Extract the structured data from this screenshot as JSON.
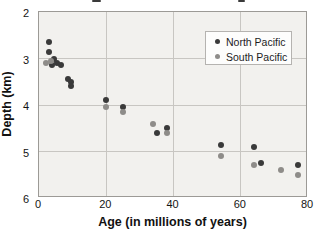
{
  "figure": {
    "y_axis_label": "Depth (km)",
    "x_axis_label": "Age (in millions of years)"
  },
  "chart_data": {
    "type": "scatter",
    "title": "",
    "xlabel": "Age (in millions of years)",
    "ylabel": "Depth (km)",
    "xlim": [
      0,
      80
    ],
    "ylim": [
      2,
      6
    ],
    "y_inverted": true,
    "grid": true,
    "legend_position": "top-right",
    "x_ticks": [
      0,
      20,
      40,
      60,
      80
    ],
    "y_ticks": [
      2,
      3,
      4,
      5,
      6
    ],
    "colors": {
      "plot_background": "#f2f1ee",
      "gridline": "#c8c6c2",
      "border": "#9c9a96",
      "north_pacific": "#3a3a3a",
      "south_pacific": "#8e8c89"
    },
    "series": [
      {
        "name": "North Pacific",
        "color": "#3a3a3a",
        "points": [
          [
            3,
            2.65
          ],
          [
            3,
            2.85
          ],
          [
            4,
            3.15
          ],
          [
            4.5,
            3.0
          ],
          [
            5.5,
            3.1
          ],
          [
            6.5,
            3.15
          ],
          [
            8.5,
            3.45
          ],
          [
            9.5,
            3.5
          ],
          [
            9.5,
            3.6
          ],
          [
            20,
            3.9
          ],
          [
            25,
            4.05
          ],
          [
            35,
            4.6
          ],
          [
            38,
            4.5
          ],
          [
            54,
            4.85
          ],
          [
            64,
            4.9
          ],
          [
            66,
            5.25
          ],
          [
            77,
            5.3
          ]
        ]
      },
      {
        "name": "South Pacific",
        "color": "#8e8c89",
        "points": [
          [
            2,
            3.1
          ],
          [
            3.5,
            3.05
          ],
          [
            20,
            4.05
          ],
          [
            25,
            4.15
          ],
          [
            34,
            4.4
          ],
          [
            38,
            4.6
          ],
          [
            54,
            5.1
          ],
          [
            64,
            5.3
          ],
          [
            72,
            5.4
          ],
          [
            77,
            5.5
          ]
        ]
      }
    ]
  }
}
